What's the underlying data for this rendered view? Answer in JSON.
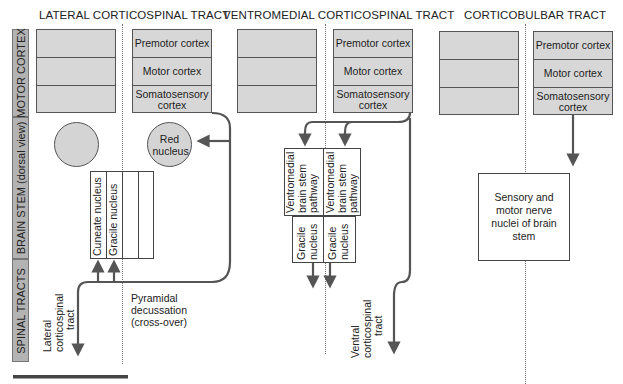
{
  "side_labels": {
    "motor_cortex": "MOTOR CORTEX",
    "brain_stem": "BRAIN STEM (dorsal view)",
    "spinal_tracts": "SPINAL TRACTS"
  },
  "panels": [
    {
      "title": "LATERAL CORTICOSPINAL TRACT",
      "cortex_cells": [
        "Premotor cortex",
        "Motor cortex",
        "Somatosensory cortex"
      ],
      "brain_stem": {
        "red_nucleus": "Red nucleus",
        "nuclei": [
          "Cuneate nucleus",
          "Gracile nucleus"
        ]
      },
      "annotations": {
        "decussation": [
          "Pyramidal",
          "decussation",
          "(cross-over)"
        ],
        "tract": [
          "Lateral",
          "corticospinal",
          "tract"
        ]
      }
    },
    {
      "title": "VENTROMEDIAL CORTICOSPINAL TRACT",
      "cortex_cells": [
        "Premotor cortex",
        "Motor cortex",
        "Somatosensory cortex"
      ],
      "brain_stem": {
        "pathways": [
          [
            "Ventromedial",
            "brain stem",
            "pathway"
          ],
          [
            "Ventromedial",
            "brain stem",
            "pathway"
          ]
        ],
        "nuclei": [
          [
            "Gracile",
            "nucleus"
          ],
          [
            "Gracile",
            "nucleus"
          ]
        ]
      },
      "annotations": {
        "tract": [
          "Ventral",
          "corticospinal",
          "tract"
        ]
      }
    },
    {
      "title": "CORTICOBULBAR TRACT",
      "cortex_cells": [
        "Premotor cortex",
        "Motor cortex",
        "Somatosensory cortex"
      ],
      "brain_stem": {
        "target": "Sensory and motor nerve nuclei of brain stem"
      }
    }
  ],
  "colors": {
    "cortex_fill": "#d7d7d7",
    "side_bar_fill": "#b3b3b3",
    "arrow": "#555555",
    "dotted_midline": "#777777"
  }
}
